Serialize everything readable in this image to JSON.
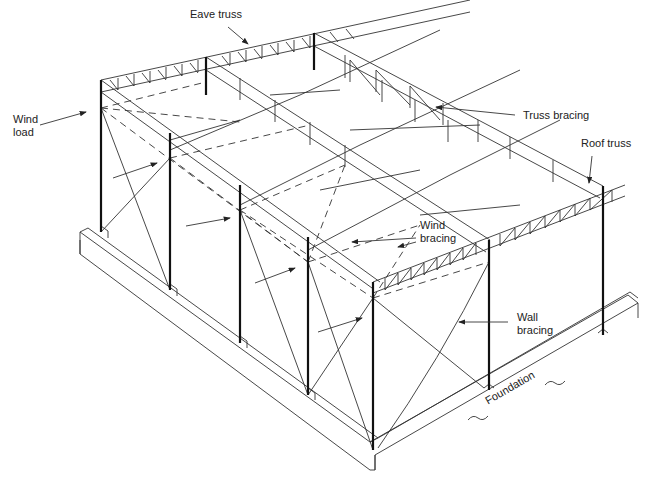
{
  "diagram": {
    "type": "isometric steel building frame",
    "labels": {
      "eave_truss": "Eave truss",
      "wind_load_line1": "Wind",
      "wind_load_line2": "load",
      "truss_bracing": "Truss bracing",
      "roof_truss": "Roof truss",
      "wind_bracing_line1": "Wind",
      "wind_bracing_line2": "bracing",
      "wall_bracing_line1": "Wall",
      "wall_bracing_line2": "bracing",
      "foundation": "Foundation"
    },
    "colors": {
      "line": "#333333",
      "column": "#111111",
      "background": "#ffffff"
    }
  }
}
